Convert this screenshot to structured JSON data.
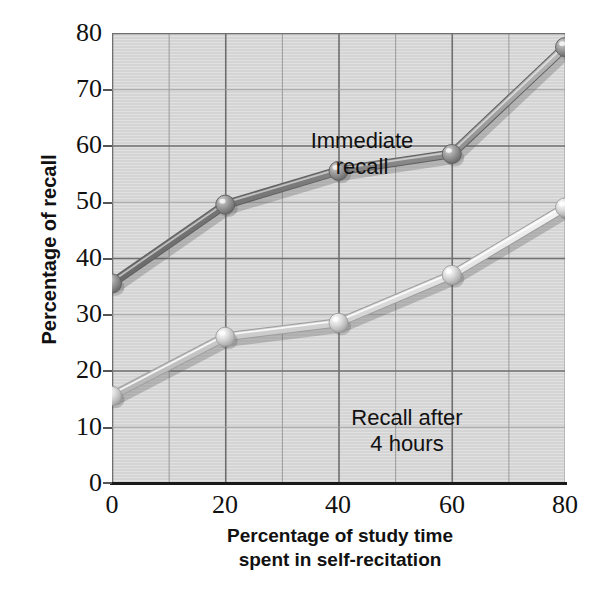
{
  "chart_data": {
    "type": "line",
    "title": "",
    "xlabel": "Percentage of study time spent in self-recitation",
    "ylabel": "Percentage of recall",
    "xlim": [
      0,
      80
    ],
    "ylim": [
      0,
      80
    ],
    "x": [
      0,
      20,
      40,
      60,
      80
    ],
    "xticks": [
      "0",
      "20",
      "40",
      "60",
      "80"
    ],
    "yticks": [
      "0",
      "10",
      "20",
      "30",
      "40",
      "50",
      "60",
      "70",
      "80"
    ],
    "grid": true,
    "grid_x_step": 10,
    "grid_y_step": 10,
    "legend_position": "inline-annotations",
    "series": [
      {
        "name": "Immediate recall",
        "values": [
          35.5,
          49.5,
          55.5,
          58.5,
          77.5
        ],
        "color": "#8a8a8a",
        "marker": "sphere"
      },
      {
        "name": "Recall after 4 hours",
        "values": [
          15.5,
          26.0,
          28.5,
          37.0,
          49.0
        ],
        "color": "#d0d0d0",
        "marker": "sphere"
      }
    ],
    "annotations": [
      {
        "text_line1": "Immediate",
        "text_line2": "recall",
        "x": 28,
        "y": 68
      },
      {
        "text_line1": "Recall after",
        "text_line2": "4 hours",
        "x": 38,
        "y": 20
      }
    ]
  },
  "axis": {
    "y_title": "Percentage of recall",
    "x_title_line1": "Percentage of study time",
    "x_title_line2": "spent in self-recitation",
    "y_tick_0": "0",
    "y_tick_10": "10",
    "y_tick_20": "20",
    "y_tick_30": "30",
    "y_tick_40": "40",
    "y_tick_50": "50",
    "y_tick_60": "60",
    "y_tick_70": "70",
    "y_tick_80": "80",
    "x_tick_0": "0",
    "x_tick_20": "20",
    "x_tick_40": "40",
    "x_tick_60": "60",
    "x_tick_80": "80"
  },
  "annotations": {
    "immediate_line1": "Immediate",
    "immediate_line2": "recall",
    "delayed_line1": "Recall after",
    "delayed_line2": "4 hours"
  },
  "colors": {
    "plot_background": "#d4d4d4",
    "grid_major": "#6f6f6f",
    "grid_minor": "#9a9a9a",
    "axis": "#1a1a1a",
    "series_immediate": "#8a8a8a",
    "series_delayed": "#d8d8d8",
    "text": "#111111"
  }
}
